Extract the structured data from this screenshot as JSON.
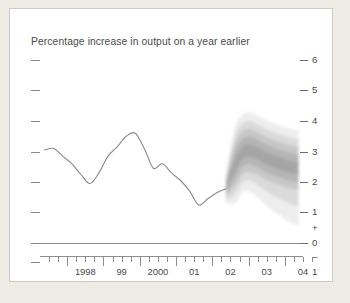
{
  "chart_data": {
    "type": "area",
    "title": "Percentage increase in output on a year earlier",
    "xlabel": "",
    "ylabel": "",
    "ylim": [
      -1,
      6
    ],
    "xlim": [
      1997.25,
      2004.5
    ],
    "grid": false,
    "legend_position": "none",
    "y_ticks": [
      "6",
      "5",
      "4",
      "3",
      "2",
      "1",
      "0",
      "1"
    ],
    "y_tick_values": [
      6,
      5,
      4,
      3,
      2,
      1,
      0,
      -1
    ],
    "y_sign_markers": [
      "+",
      "−"
    ],
    "x_tick_labels": [
      "1998",
      "99",
      "2000",
      "01",
      "02",
      "03",
      "04"
    ],
    "x_tick_values": [
      1998,
      1999,
      2000,
      2001,
      2002,
      2003,
      2004
    ],
    "x_minor_ticks_per_year": 4,
    "series": [
      {
        "name": "Output growth (history)",
        "type": "line",
        "color": "#8d8d8d",
        "x": [
          1997.375,
          1997.625,
          1997.875,
          1998.125,
          1998.375,
          1998.625,
          1998.875,
          1999.125,
          1999.375,
          1999.625,
          1999.875,
          2000.125,
          2000.375,
          2000.625,
          2000.875,
          2001.125,
          2001.375,
          2001.625,
          2001.875,
          2002.125,
          2002.375
        ],
        "values": [
          3.05,
          3.1,
          2.85,
          2.6,
          2.25,
          1.95,
          2.3,
          2.85,
          3.15,
          3.5,
          3.6,
          3.1,
          2.45,
          2.6,
          2.3,
          2.05,
          1.7,
          1.25,
          1.45,
          1.65,
          1.78
        ]
      },
      {
        "name": "Forecast fan (probability distribution)",
        "type": "fan",
        "color": "#a8a8a8",
        "central_x": [
          2002.375,
          2002.625,
          2002.875,
          2003.125,
          2003.375,
          2003.625,
          2003.875,
          2004.125,
          2004.375
        ],
        "central_values": [
          1.78,
          2.55,
          3.0,
          3.0,
          2.85,
          2.7,
          2.6,
          2.5,
          2.45
        ],
        "bands": [
          {
            "percentile": 10,
            "upper": [
              1.85,
              2.75,
              3.2,
              3.2,
              3.05,
              2.9,
              2.8,
              2.7,
              2.65
            ],
            "lower": [
              1.72,
              2.35,
              2.8,
              2.8,
              2.65,
              2.5,
              2.4,
              2.3,
              2.25
            ]
          },
          {
            "percentile": 30,
            "upper": [
              1.95,
              3.0,
              3.45,
              3.45,
              3.3,
              3.15,
              3.05,
              2.95,
              2.9
            ],
            "lower": [
              1.62,
              2.1,
              2.55,
              2.55,
              2.4,
              2.25,
              2.15,
              2.05,
              2.0
            ]
          },
          {
            "percentile": 50,
            "upper": [
              2.05,
              3.25,
              3.7,
              3.7,
              3.55,
              3.4,
              3.3,
              3.2,
              3.15
            ],
            "lower": [
              1.52,
              1.85,
              2.3,
              2.3,
              2.15,
              2.0,
              1.9,
              1.8,
              1.75
            ]
          },
          {
            "percentile": 70,
            "upper": [
              2.15,
              3.5,
              3.95,
              3.95,
              3.8,
              3.65,
              3.55,
              3.45,
              3.4
            ],
            "lower": [
              1.42,
              1.6,
              2.05,
              2.0,
              1.8,
              1.6,
              1.45,
              1.3,
              1.2
            ]
          },
          {
            "percentile": 90,
            "upper": [
              2.28,
              3.8,
              4.25,
              4.25,
              4.1,
              3.95,
              3.85,
              3.75,
              3.7
            ],
            "lower": [
              1.3,
              1.3,
              1.7,
              1.6,
              1.35,
              1.1,
              0.9,
              0.7,
              0.55
            ]
          }
        ]
      }
    ]
  },
  "axes": {
    "left_tick_count": 8,
    "zero_line": 0
  }
}
